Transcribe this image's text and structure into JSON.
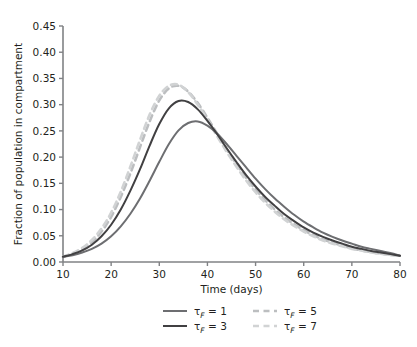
{
  "figure": {
    "top_artifact": "",
    "bottom_artifact": ""
  },
  "chart_data": {
    "type": "line",
    "title": "",
    "xlabel": "Time (days)",
    "ylabel": "Fraction of population in compartment",
    "xlim": [
      10,
      80
    ],
    "ylim": [
      0.0,
      0.45
    ],
    "xticks": [
      10,
      20,
      30,
      40,
      50,
      60,
      70,
      80
    ],
    "xtick_labels": [
      "10",
      "20",
      "30",
      "40",
      "50",
      "60",
      "70",
      "80"
    ],
    "yticks": [
      0.0,
      0.05,
      0.1,
      0.15,
      0.2,
      0.25,
      0.3,
      0.35,
      0.4,
      0.45
    ],
    "ytick_labels": [
      "0.00",
      "0.05",
      "0.10",
      "0.15",
      "0.20",
      "0.25",
      "0.30",
      "0.35",
      "0.40",
      "0.45"
    ],
    "grid": false,
    "legend_position": "below-axes",
    "x": [
      10,
      12,
      14,
      16,
      18,
      20,
      22,
      24,
      26,
      28,
      30,
      32,
      34,
      36,
      38,
      40,
      42,
      44,
      46,
      48,
      50,
      52,
      54,
      56,
      58,
      60,
      62,
      64,
      66,
      68,
      70,
      72,
      74,
      76,
      78,
      80
    ],
    "series": [
      {
        "name": "τ_F = 1",
        "legend_label": "τF = 1",
        "color": "#6d6e71",
        "style": "solid",
        "peak_x": 35,
        "peak_y": 0.268,
        "values": [
          0.01,
          0.013,
          0.018,
          0.025,
          0.035,
          0.049,
          0.068,
          0.092,
          0.121,
          0.155,
          0.191,
          0.225,
          0.251,
          0.265,
          0.268,
          0.26,
          0.245,
          0.225,
          0.203,
          0.181,
          0.159,
          0.139,
          0.121,
          0.105,
          0.09,
          0.077,
          0.066,
          0.056,
          0.048,
          0.041,
          0.035,
          0.029,
          0.025,
          0.021,
          0.017,
          0.012
        ]
      },
      {
        "name": "τ_F = 3",
        "legend_label": "τF = 3",
        "color": "#414042",
        "style": "solid",
        "peak_x": 32,
        "peak_y": 0.308,
        "values": [
          0.01,
          0.015,
          0.022,
          0.033,
          0.049,
          0.071,
          0.1,
          0.136,
          0.177,
          0.222,
          0.263,
          0.293,
          0.307,
          0.305,
          0.291,
          0.269,
          0.244,
          0.217,
          0.191,
          0.166,
          0.144,
          0.124,
          0.107,
          0.091,
          0.078,
          0.066,
          0.056,
          0.048,
          0.041,
          0.035,
          0.029,
          0.025,
          0.021,
          0.018,
          0.015,
          0.012
        ]
      },
      {
        "name": "τ_F = 5",
        "legend_label": "τF = 5",
        "color": "#bcbec0",
        "style": "dashed",
        "peak_x": 30,
        "peak_y": 0.338,
        "values": [
          0.01,
          0.016,
          0.025,
          0.038,
          0.058,
          0.086,
          0.124,
          0.169,
          0.219,
          0.268,
          0.308,
          0.331,
          0.336,
          0.325,
          0.303,
          0.275,
          0.245,
          0.215,
          0.187,
          0.161,
          0.138,
          0.118,
          0.1,
          0.085,
          0.072,
          0.061,
          0.051,
          0.043,
          0.037,
          0.031,
          0.026,
          0.022,
          0.019,
          0.016,
          0.014,
          0.012
        ]
      },
      {
        "name": "τ_F = 7",
        "legend_label": "τF = 7",
        "color": "#d1d3d4",
        "style": "dashed",
        "peak_x": 29,
        "peak_y": 0.341,
        "values": [
          0.01,
          0.017,
          0.027,
          0.042,
          0.064,
          0.094,
          0.134,
          0.182,
          0.233,
          0.281,
          0.317,
          0.336,
          0.338,
          0.324,
          0.3,
          0.271,
          0.24,
          0.21,
          0.182,
          0.156,
          0.133,
          0.113,
          0.096,
          0.081,
          0.069,
          0.058,
          0.049,
          0.041,
          0.035,
          0.03,
          0.025,
          0.022,
          0.018,
          0.016,
          0.013,
          0.012
        ]
      }
    ]
  },
  "legend": {
    "entries": [
      {
        "label": "τF = 1",
        "tau": "τ",
        "sub": "F",
        "rest": " = 1"
      },
      {
        "label": "τF = 3",
        "tau": "τ",
        "sub": "F",
        "rest": " = 3"
      },
      {
        "label": "τF = 5",
        "tau": "τ",
        "sub": "F",
        "rest": " = 5"
      },
      {
        "label": "τF = 7",
        "tau": "τ",
        "sub": "F",
        "rest": " = 7"
      }
    ]
  },
  "axes": {
    "spine_color": "#808285",
    "tick_color": "#808285"
  }
}
